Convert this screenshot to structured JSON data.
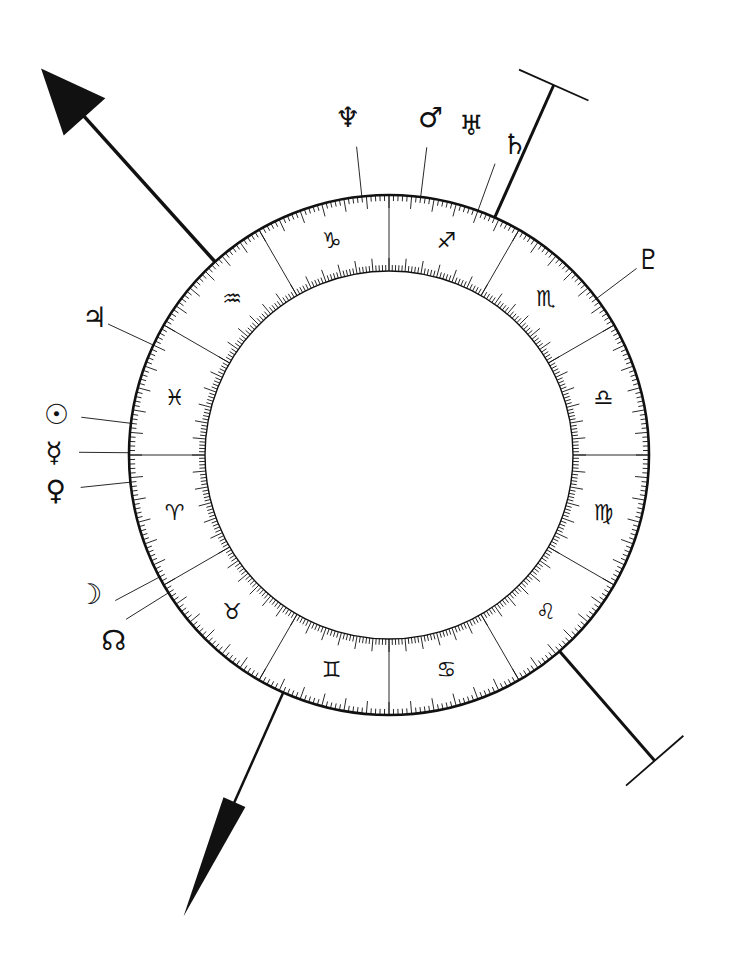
{
  "colors": {
    "ink": "#111111",
    "background": "#ffffff"
  },
  "wheel": {
    "degrees_per_sign": 30,
    "tick_every_degrees": 1,
    "medium_tick_every_degrees": 5,
    "signs": [
      {
        "name": "Libra",
        "glyph": "♎",
        "start_angle": 0
      },
      {
        "name": "Scorpio",
        "glyph": "♏",
        "start_angle": 30
      },
      {
        "name": "Sagittarius",
        "glyph": "♐",
        "start_angle": 60
      },
      {
        "name": "Capricorn",
        "glyph": "♑",
        "start_angle": 90
      },
      {
        "name": "Aquarius",
        "glyph": "♒",
        "start_angle": 120
      },
      {
        "name": "Pisces",
        "glyph": "♓",
        "start_angle": 150
      },
      {
        "name": "Aries",
        "glyph": "♈",
        "start_angle": 180
      },
      {
        "name": "Taurus",
        "glyph": "♉",
        "start_angle": 210
      },
      {
        "name": "Gemini",
        "glyph": "♊",
        "start_angle": 240
      },
      {
        "name": "Cancer",
        "glyph": "♋",
        "start_angle": 270
      },
      {
        "name": "Leo",
        "glyph": "♌",
        "start_angle": 300
      },
      {
        "name": "Virgo",
        "glyph": "♍",
        "start_angle": 330
      }
    ]
  },
  "planets": [
    {
      "name": "Neptune",
      "glyph": "♆",
      "angle": 96
    },
    {
      "name": "Mars",
      "glyph": "♂",
      "angle": 83
    },
    {
      "name": "Uranus",
      "glyph": "♅",
      "angle": 76,
      "shares_line_with": "Mars"
    },
    {
      "name": "Saturn",
      "glyph": "♄",
      "angle": 70
    },
    {
      "name": "Pluto",
      "glyph": "♇",
      "angle": 37
    },
    {
      "name": "Jupiter",
      "glyph": "♃",
      "angle": 155
    },
    {
      "name": "Sun",
      "glyph": "☉",
      "angle": 173
    },
    {
      "name": "Mercury",
      "glyph": "☿",
      "angle": 179.5
    },
    {
      "name": "Venus",
      "glyph": "♀",
      "angle": 186
    },
    {
      "name": "Moon",
      "glyph": "☽",
      "angle": 208
    },
    {
      "name": "North Node",
      "glyph": "☊",
      "angle": 212
    }
  ],
  "axes": [
    {
      "name": "ascendant-arrow",
      "angle": 132,
      "style": "broad-arrow"
    },
    {
      "name": "descendant-arrow",
      "angle": 246,
      "style": "narrow-arrow"
    },
    {
      "name": "midheaven-bar",
      "angle": 66,
      "style": "t-bar"
    },
    {
      "name": "imum-coeli-bar",
      "angle": 311,
      "style": "t-bar"
    }
  ]
}
